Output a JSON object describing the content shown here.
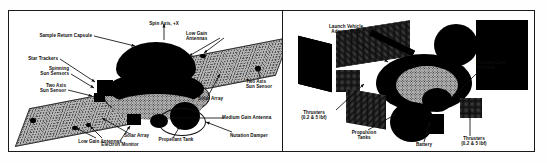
{
  "figure": {
    "panels": [
      {
        "id": "spacecraft-configuration",
        "labels": [
          {
            "key": "spin_axis",
            "text": "Spin Axis, +X"
          },
          {
            "key": "sample_return",
            "text": "Sample Return Capsule"
          },
          {
            "key": "star_trackers",
            "text": "Star Trackers"
          },
          {
            "key": "spinning_sun",
            "text": "Spinning\nSun Sensors"
          },
          {
            "key": "two_axis_sun_l",
            "text": "Two Axis\nSun Sensor"
          },
          {
            "key": "low_gain_top",
            "text": "Low Gain\nAntennas"
          },
          {
            "key": "two_axis_sun_r",
            "text": "Two Axis\nSun Sensor"
          },
          {
            "key": "solar_array_r",
            "text": "Solar Array"
          },
          {
            "key": "solar_array_l",
            "text": "Solar Array"
          },
          {
            "key": "low_gain_bottom",
            "text": "Low Gain Antennas"
          },
          {
            "key": "electron_monitor",
            "text": "Electron Monitor"
          },
          {
            "key": "propellant_tank",
            "text": "Propellant Tank"
          },
          {
            "key": "nutation_damper",
            "text": "Nutation Damper"
          },
          {
            "key": "medium_gain_l",
            "text": "Medium Gain Antenna"
          }
        ]
      },
      {
        "id": "spacecraft-hardware-photo",
        "labels": [
          {
            "key": "launch_adapter",
            "text": "Launch Vehicle\nAdapter Ring"
          },
          {
            "key": "medium_gain_r",
            "text": "Medium Gain\nAntenna"
          },
          {
            "key": "thrusters_left",
            "text": "Thrusters\n(0.2 & 5 lbf)"
          },
          {
            "key": "propulsion_tanks",
            "text": "Propulsion\nTanks"
          },
          {
            "key": "battery",
            "text": "Battery"
          },
          {
            "key": "thrusters_right",
            "text": "Thrusters\n(0.2 & 5 lbf)"
          }
        ]
      }
    ]
  },
  "colors": {
    "ink": "#0d0d0d",
    "frame": "#1a1a1a",
    "paper": "#ffffff",
    "halftone_mid": "#8d8d8d",
    "halftone_dark": "#2a2a2a",
    "halftone_light": "#c9c9c9",
    "array_face": "#b7b7b7"
  }
}
